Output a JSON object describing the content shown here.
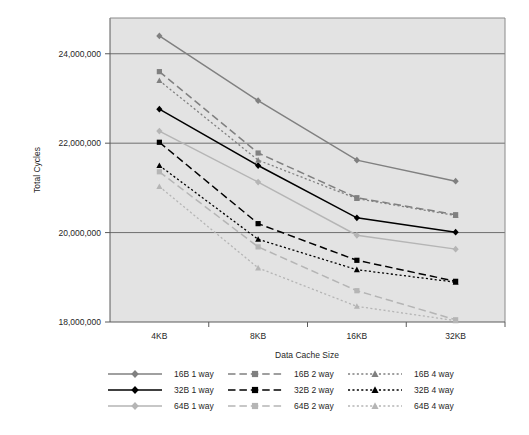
{
  "chart_data": {
    "type": "line",
    "title": "",
    "xlabel": "Data Cache Size",
    "ylabel": "Total Cycles",
    "categories": [
      "4KB",
      "8KB",
      "16KB",
      "32KB"
    ],
    "ylim": [
      18000000,
      24800000
    ],
    "yticks": [
      18000000,
      20000000,
      22000000,
      24000000
    ],
    "ytick_labels": [
      "18,000,000",
      "20,000,000",
      "22,000,000",
      "24,000,000"
    ],
    "grid": "horizontal",
    "legend_position": "bottom",
    "legend_columns": 3,
    "plot_background": "#e3e3e3",
    "series": [
      {
        "name": "16B 1 way",
        "color": "#808080",
        "line_style": "solid",
        "marker": "diamond",
        "values": [
          24400000,
          22950000,
          21620000,
          21150000
        ]
      },
      {
        "name": "32B 1 way",
        "color": "#000000",
        "line_style": "solid",
        "marker": "diamond",
        "values": [
          22760000,
          21500000,
          20330000,
          20010000
        ]
      },
      {
        "name": "64B 1 way",
        "color": "#b5b5b5",
        "line_style": "solid",
        "marker": "diamond",
        "values": [
          22270000,
          21130000,
          19940000,
          19630000
        ]
      },
      {
        "name": "16B 2 way",
        "color": "#808080",
        "line_style": "dashed",
        "marker": "square",
        "values": [
          23600000,
          21780000,
          20780000,
          20400000
        ]
      },
      {
        "name": "32B 2 way",
        "color": "#000000",
        "line_style": "dashed",
        "marker": "square",
        "values": [
          22020000,
          20200000,
          19380000,
          18910000
        ]
      },
      {
        "name": "64B 2 way",
        "color": "#b5b5b5",
        "line_style": "dashed",
        "marker": "square",
        "values": [
          21360000,
          19680000,
          18700000,
          18050000
        ]
      },
      {
        "name": "16B 4 way",
        "color": "#808080",
        "line_style": "dotted",
        "marker": "triangle",
        "values": [
          23400000,
          21620000,
          20760000,
          20380000
        ]
      },
      {
        "name": "32B 4 way",
        "color": "#000000",
        "line_style": "dotted",
        "marker": "triangle",
        "values": [
          21500000,
          19850000,
          19170000,
          18890000
        ]
      },
      {
        "name": "64B 4 way",
        "color": "#b5b5b5",
        "line_style": "dotted",
        "marker": "triangle",
        "values": [
          21030000,
          19210000,
          18350000,
          18030000
        ]
      }
    ]
  },
  "legend": {
    "columns": [
      {
        "items": [
          "16B 1 way",
          "32B 1 way",
          "64B 1 way"
        ]
      },
      {
        "items": [
          "16B 2 way",
          "32B 2 way",
          "64B 2 way"
        ]
      },
      {
        "items": [
          "16B 4 way",
          "32B 4 way",
          "64B 4 way"
        ]
      }
    ]
  }
}
